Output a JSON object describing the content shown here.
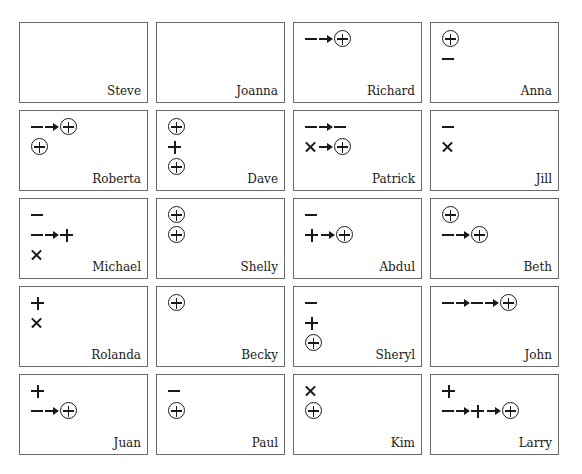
{
  "cards": [
    {
      "name": "Steve",
      "lines": []
    },
    {
      "name": "Joanna",
      "lines": []
    },
    {
      "name": "Richard",
      "lines": [
        [
          "minus",
          "arrow",
          "circled-plus"
        ]
      ]
    },
    {
      "name": "Anna",
      "lines": [
        [
          "circled-plus"
        ],
        [
          "minus"
        ]
      ]
    },
    {
      "name": "Roberta",
      "lines": [
        [
          "minus",
          "arrow",
          "circled-plus"
        ],
        [
          "circled-plus"
        ]
      ]
    },
    {
      "name": "Dave",
      "lines": [
        [
          "circled-plus"
        ],
        [
          "plus"
        ],
        [
          "circled-plus"
        ]
      ]
    },
    {
      "name": "Patrick",
      "lines": [
        [
          "minus",
          "arrow",
          "minus"
        ],
        [
          "times",
          "arrow",
          "circled-plus"
        ]
      ]
    },
    {
      "name": "Jill",
      "lines": [
        [
          "minus"
        ],
        [
          "times"
        ]
      ]
    },
    {
      "name": "Michael",
      "lines": [
        [
          "minus"
        ],
        [
          "minus",
          "arrow",
          "plus"
        ],
        [
          "times"
        ]
      ]
    },
    {
      "name": "Shelly",
      "lines": [
        [
          "circled-plus"
        ],
        [
          "circled-plus"
        ]
      ]
    },
    {
      "name": "Abdul",
      "lines": [
        [
          "minus"
        ],
        [
          "plus",
          "arrow",
          "circled-plus"
        ]
      ]
    },
    {
      "name": "Beth",
      "lines": [
        [
          "circled-plus"
        ],
        [
          "minus",
          "arrow",
          "circled-plus"
        ]
      ]
    },
    {
      "name": "Rolanda",
      "lines": [
        [
          "plus"
        ],
        [
          "times"
        ]
      ]
    },
    {
      "name": "Becky",
      "lines": [
        [
          "circled-plus"
        ]
      ]
    },
    {
      "name": "Sheryl",
      "lines": [
        [
          "minus"
        ],
        [
          "plus"
        ],
        [
          "circled-plus"
        ]
      ]
    },
    {
      "name": "John",
      "lines": [
        [
          "minus",
          "arrow",
          "minus",
          "arrow",
          "circled-plus"
        ]
      ]
    },
    {
      "name": "Juan",
      "lines": [
        [
          "plus"
        ],
        [
          "minus",
          "arrow",
          "circled-plus"
        ]
      ]
    },
    {
      "name": "Paul",
      "lines": [
        [
          "minus"
        ],
        [
          "circled-plus"
        ]
      ]
    },
    {
      "name": "Kim",
      "lines": [
        [
          "times"
        ],
        [
          "circled-plus"
        ]
      ]
    },
    {
      "name": "Larry",
      "lines": [
        [
          "plus"
        ],
        [
          "minus",
          "arrow",
          "plus",
          "arrow",
          "circled-plus"
        ]
      ]
    }
  ],
  "legend_symbols": {
    "minus": "minus-sign",
    "plus": "plus-sign",
    "circled-plus": "circled-plus-sign",
    "times": "times-sign",
    "arrow": "right-arrow"
  }
}
